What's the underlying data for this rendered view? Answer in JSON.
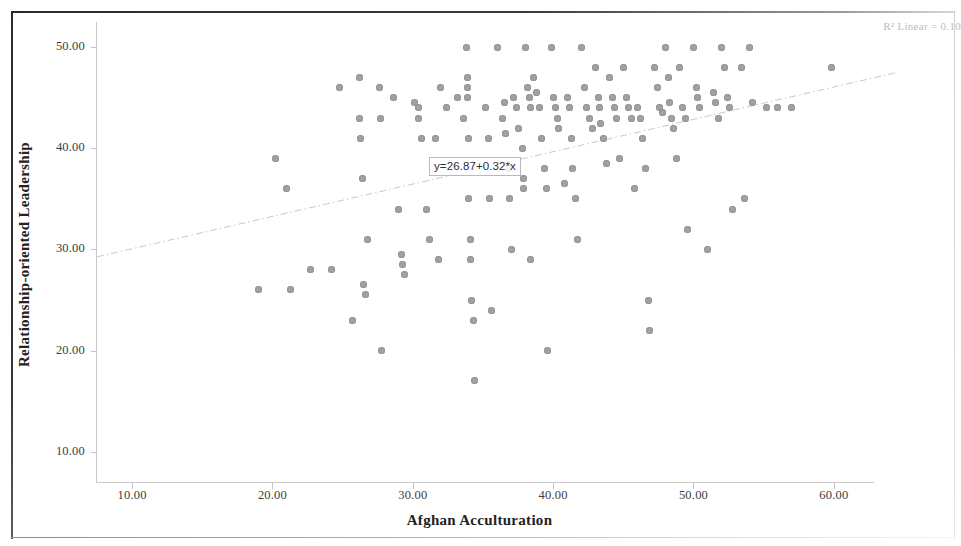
{
  "chart_data": {
    "type": "scatter",
    "title": "",
    "xlabel": "Afghan Acculturation",
    "ylabel": "Relationship-oriented Leadership",
    "xlim": [
      7.5,
      64.5
    ],
    "ylim": [
      7.0,
      52.5
    ],
    "xticks": [
      "10.00",
      "20.00",
      "30.00",
      "40.00",
      "50.00",
      "60.00"
    ],
    "xtick_values": [
      10,
      20,
      30,
      40,
      50,
      60
    ],
    "yticks": [
      "10.00",
      "20.00",
      "30.00",
      "40.00",
      "50.00"
    ],
    "ytick_values": [
      10,
      20,
      30,
      40,
      50
    ],
    "grid": false,
    "legend": "none",
    "marker_color": "#9a9a9a",
    "fit_line": {
      "type": "linear",
      "equation_label": "y=26.87+0.32*x",
      "intercept": 26.87,
      "slope": 0.32,
      "color": "#c8c8c8",
      "style": "dash-dot"
    },
    "r_squared_label": "R² Linear = 0.10",
    "points": [
      [
        19.0,
        26.0
      ],
      [
        20.2,
        39.0
      ],
      [
        21.0,
        36.0
      ],
      [
        21.3,
        26.0
      ],
      [
        22.7,
        28.0
      ],
      [
        24.2,
        28.0
      ],
      [
        24.8,
        46.0
      ],
      [
        25.7,
        23.0
      ],
      [
        26.2,
        47.0
      ],
      [
        26.2,
        43.0
      ],
      [
        26.3,
        41.0
      ],
      [
        26.4,
        37.0
      ],
      [
        26.5,
        26.5
      ],
      [
        26.6,
        25.5
      ],
      [
        26.8,
        31.0
      ],
      [
        27.6,
        46.0
      ],
      [
        27.7,
        43.0
      ],
      [
        27.8,
        20.0
      ],
      [
        28.6,
        45.0
      ],
      [
        29.0,
        34.0
      ],
      [
        29.2,
        29.5
      ],
      [
        29.3,
        28.5
      ],
      [
        29.4,
        27.5
      ],
      [
        30.1,
        44.5
      ],
      [
        30.4,
        44.0
      ],
      [
        30.4,
        43.0
      ],
      [
        30.6,
        41.0
      ],
      [
        31.0,
        34.0
      ],
      [
        31.2,
        31.0
      ],
      [
        31.6,
        41.0
      ],
      [
        31.8,
        29.0
      ],
      [
        32.0,
        46.0
      ],
      [
        32.4,
        44.0
      ],
      [
        33.2,
        45.0
      ],
      [
        33.6,
        43.0
      ],
      [
        33.8,
        50.0
      ],
      [
        33.9,
        47.0
      ],
      [
        33.9,
        46.0
      ],
      [
        33.9,
        45.0
      ],
      [
        34.0,
        41.0
      ],
      [
        34.0,
        35.0
      ],
      [
        34.1,
        31.0
      ],
      [
        34.1,
        29.0
      ],
      [
        34.2,
        25.0
      ],
      [
        34.3,
        23.0
      ],
      [
        34.4,
        17.0
      ],
      [
        35.2,
        44.0
      ],
      [
        35.4,
        41.0
      ],
      [
        35.5,
        35.0
      ],
      [
        35.6,
        24.0
      ],
      [
        36.0,
        50.0
      ],
      [
        36.4,
        43.0
      ],
      [
        36.5,
        44.5
      ],
      [
        36.6,
        41.5
      ],
      [
        36.8,
        38.0
      ],
      [
        36.9,
        35.0
      ],
      [
        37.0,
        30.0
      ],
      [
        37.2,
        45.0
      ],
      [
        37.4,
        44.0
      ],
      [
        37.5,
        42.0
      ],
      [
        37.8,
        40.0
      ],
      [
        37.9,
        37.0
      ],
      [
        37.9,
        36.0
      ],
      [
        38.0,
        50.0
      ],
      [
        38.2,
        46.0
      ],
      [
        38.3,
        45.0
      ],
      [
        38.4,
        44.0
      ],
      [
        38.4,
        29.0
      ],
      [
        38.6,
        47.0
      ],
      [
        38.8,
        45.5
      ],
      [
        39.0,
        44.0
      ],
      [
        39.2,
        41.0
      ],
      [
        39.4,
        38.0
      ],
      [
        39.5,
        36.0
      ],
      [
        39.6,
        20.0
      ],
      [
        39.9,
        50.0
      ],
      [
        40.0,
        45.0
      ],
      [
        40.2,
        44.0
      ],
      [
        40.3,
        43.0
      ],
      [
        40.4,
        42.0
      ],
      [
        40.8,
        36.5
      ],
      [
        41.0,
        45.0
      ],
      [
        41.2,
        44.0
      ],
      [
        41.3,
        41.0
      ],
      [
        41.4,
        38.0
      ],
      [
        41.6,
        35.0
      ],
      [
        41.7,
        31.0
      ],
      [
        42.0,
        50.0
      ],
      [
        42.2,
        46.0
      ],
      [
        42.4,
        44.0
      ],
      [
        42.6,
        43.0
      ],
      [
        42.8,
        42.0
      ],
      [
        43.0,
        48.0
      ],
      [
        43.2,
        45.0
      ],
      [
        43.3,
        44.0
      ],
      [
        43.4,
        42.5
      ],
      [
        43.6,
        41.0
      ],
      [
        43.8,
        38.5
      ],
      [
        44.0,
        47.0
      ],
      [
        44.2,
        45.0
      ],
      [
        44.4,
        44.0
      ],
      [
        44.5,
        43.0
      ],
      [
        44.7,
        39.0
      ],
      [
        45.0,
        48.0
      ],
      [
        45.2,
        45.0
      ],
      [
        45.4,
        44.0
      ],
      [
        45.6,
        43.0
      ],
      [
        45.8,
        36.0
      ],
      [
        46.0,
        44.0
      ],
      [
        46.2,
        43.0
      ],
      [
        46.4,
        41.0
      ],
      [
        46.6,
        38.0
      ],
      [
        46.8,
        25.0
      ],
      [
        46.9,
        22.0
      ],
      [
        47.2,
        48.0
      ],
      [
        47.4,
        46.0
      ],
      [
        47.6,
        44.0
      ],
      [
        47.8,
        43.5
      ],
      [
        48.0,
        50.0
      ],
      [
        48.2,
        47.0
      ],
      [
        48.3,
        44.5
      ],
      [
        48.4,
        43.0
      ],
      [
        48.6,
        42.0
      ],
      [
        48.8,
        39.0
      ],
      [
        49.0,
        48.0
      ],
      [
        49.2,
        44.0
      ],
      [
        49.4,
        43.0
      ],
      [
        49.6,
        32.0
      ],
      [
        50.0,
        50.0
      ],
      [
        50.2,
        46.0
      ],
      [
        50.3,
        45.0
      ],
      [
        50.4,
        44.0
      ],
      [
        51.0,
        30.0
      ],
      [
        51.4,
        45.5
      ],
      [
        51.6,
        44.5
      ],
      [
        51.8,
        43.0
      ],
      [
        52.0,
        50.0
      ],
      [
        52.2,
        48.0
      ],
      [
        52.4,
        45.0
      ],
      [
        52.6,
        44.0
      ],
      [
        52.8,
        34.0
      ],
      [
        53.4,
        48.0
      ],
      [
        53.6,
        35.0
      ],
      [
        54.0,
        50.0
      ],
      [
        54.2,
        44.5
      ],
      [
        55.2,
        44.0
      ],
      [
        56.0,
        44.0
      ],
      [
        57.0,
        44.0
      ],
      [
        59.8,
        48.0
      ]
    ]
  },
  "axes": {
    "x_title": "Afghan Acculturation",
    "y_title": "Relationship-oriented Leadership"
  }
}
